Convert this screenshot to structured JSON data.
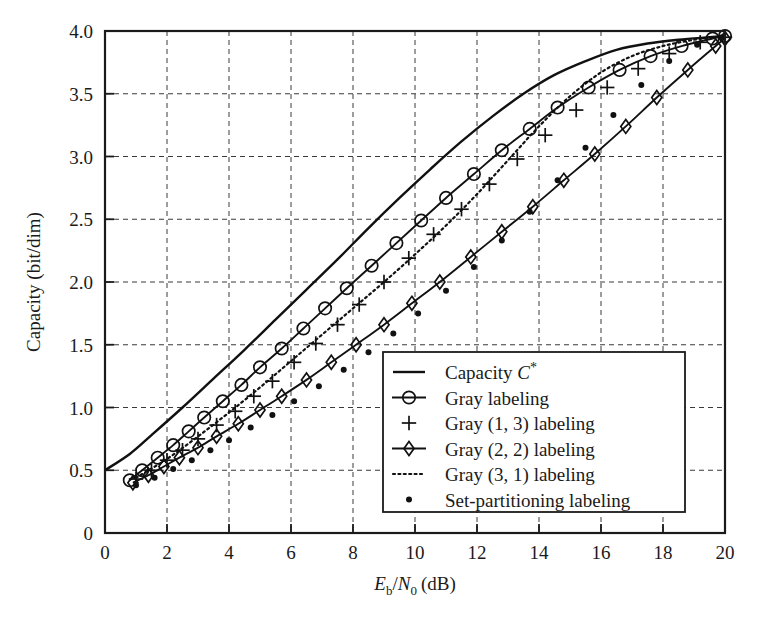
{
  "chart_data": {
    "type": "line",
    "title": "",
    "xlabel": "E_b/N_0 (dB)",
    "xlabel_parts": {
      "main": "E",
      "sub1": "b",
      "slash": "/",
      "main2": "N",
      "sub2": "0",
      "unit": "(dB)"
    },
    "ylabel": "Capacity (bit/dim)",
    "xlim": [
      0,
      20
    ],
    "ylim": [
      0,
      4.0
    ],
    "xticks": [
      0,
      2,
      4,
      6,
      8,
      10,
      12,
      14,
      16,
      18,
      20
    ],
    "xticklabels": [
      "0",
      "2",
      "4",
      "6",
      "8",
      "10",
      "12",
      "14",
      "16",
      "18",
      "20"
    ],
    "yticks": [
      0,
      0.5,
      1.0,
      1.5,
      2.0,
      2.5,
      3.0,
      3.5,
      4.0
    ],
    "yticklabels": [
      "0",
      "0.5",
      "1.0",
      "1.5",
      "2.0",
      "2.5",
      "3.0",
      "3.5",
      "4.0"
    ],
    "grid": true,
    "grid_style": "dashed",
    "legend_position": "lower-right-inside",
    "series": [
      {
        "name": "Capacity C*",
        "label_main": "Capacity",
        "label_italic": "C",
        "label_sup": "*",
        "style": "solid",
        "marker": "none",
        "color": "#111111",
        "x": [
          0.0,
          0.8,
          1.5,
          2.5,
          3.5,
          4.5,
          5.5,
          6.5,
          7.5,
          8.5,
          9.5,
          10.5,
          11.5,
          12.5,
          13.5,
          14.5,
          15.5,
          16.5,
          17.5,
          18.5,
          19.5,
          20.0
        ],
        "y": [
          0.5,
          0.63,
          0.78,
          1.0,
          1.23,
          1.46,
          1.7,
          1.94,
          2.18,
          2.43,
          2.67,
          2.9,
          3.12,
          3.32,
          3.5,
          3.65,
          3.76,
          3.85,
          3.9,
          3.93,
          3.95,
          3.96
        ]
      },
      {
        "name": "Gray labeling",
        "label_main": "Gray labeling",
        "style": "solid",
        "marker": "circle",
        "color": "#111111",
        "x": [
          0.8,
          1.2,
          1.7,
          2.2,
          2.7,
          3.2,
          3.8,
          4.4,
          5.0,
          5.7,
          6.4,
          7.1,
          7.8,
          8.6,
          9.4,
          10.2,
          11.0,
          11.9,
          12.8,
          13.7,
          14.6,
          15.6,
          16.6,
          17.6,
          18.6,
          19.6,
          20.0
        ],
        "y": [
          0.42,
          0.5,
          0.6,
          0.7,
          0.81,
          0.92,
          1.05,
          1.18,
          1.32,
          1.47,
          1.63,
          1.79,
          1.95,
          2.13,
          2.31,
          2.49,
          2.67,
          2.86,
          3.05,
          3.22,
          3.39,
          3.55,
          3.69,
          3.8,
          3.88,
          3.94,
          3.96
        ]
      },
      {
        "name": "Gray (1, 3) labeling",
        "label_main": "Gray (1, 3) labeling",
        "style": "markers",
        "marker": "plus",
        "color": "#111111",
        "x": [
          1.0,
          1.5,
          2.0,
          2.5,
          3.0,
          3.6,
          4.2,
          4.8,
          5.4,
          6.1,
          6.8,
          7.5,
          8.2,
          9.0,
          9.8,
          10.6,
          11.5,
          12.4,
          13.3,
          14.2,
          15.2,
          16.2,
          17.2,
          18.2,
          19.2,
          20.0
        ],
        "y": [
          0.43,
          0.5,
          0.58,
          0.66,
          0.75,
          0.86,
          0.97,
          1.09,
          1.21,
          1.36,
          1.51,
          1.66,
          1.82,
          2.0,
          2.19,
          2.38,
          2.58,
          2.78,
          2.98,
          3.17,
          3.37,
          3.55,
          3.7,
          3.82,
          3.91,
          3.95
        ]
      },
      {
        "name": "Gray (2, 2) labeling",
        "label_main": "Gray (2, 2) labeling",
        "style": "solid",
        "marker": "diamond",
        "color": "#111111",
        "x": [
          0.9,
          1.4,
          1.9,
          2.4,
          3.0,
          3.6,
          4.3,
          5.0,
          5.7,
          6.5,
          7.3,
          8.1,
          9.0,
          9.9,
          10.8,
          11.8,
          12.8,
          13.8,
          14.8,
          15.8,
          16.8,
          17.8,
          18.8,
          19.7,
          20.0
        ],
        "y": [
          0.4,
          0.46,
          0.53,
          0.6,
          0.68,
          0.77,
          0.87,
          0.98,
          1.09,
          1.22,
          1.36,
          1.5,
          1.66,
          1.83,
          2.0,
          2.2,
          2.4,
          2.6,
          2.81,
          3.02,
          3.24,
          3.47,
          3.69,
          3.88,
          3.94
        ]
      },
      {
        "name": "Gray (3, 1) labeling",
        "label_main": "Gray (3, 1) labeling",
        "style": "dotted",
        "marker": "none",
        "color": "#111111",
        "x": [
          1.0,
          2.0,
          3.0,
          4.0,
          5.0,
          6.0,
          7.0,
          8.0,
          9.0,
          10.0,
          11.0,
          12.0,
          13.0,
          14.0,
          15.0,
          16.0,
          17.0,
          18.0,
          19.0,
          20.0
        ],
        "y": [
          0.44,
          0.59,
          0.77,
          0.96,
          1.16,
          1.37,
          1.58,
          1.79,
          2.0,
          2.22,
          2.45,
          2.7,
          2.97,
          3.24,
          3.48,
          3.67,
          3.8,
          3.88,
          3.93,
          3.96
        ]
      },
      {
        "name": "Set-partitioning labeling",
        "label_main": "Set-partitioning labeling",
        "style": "markers",
        "marker": "dot",
        "color": "#111111",
        "x": [
          1.0,
          1.6,
          2.2,
          2.8,
          3.4,
          4.0,
          4.7,
          5.4,
          6.1,
          6.9,
          7.7,
          8.5,
          9.3,
          10.1,
          11.0,
          11.9,
          12.8,
          13.7,
          14.6,
          15.5,
          16.4,
          17.3,
          18.2,
          19.1,
          19.9
        ],
        "y": [
          0.38,
          0.44,
          0.51,
          0.58,
          0.66,
          0.74,
          0.84,
          0.94,
          1.05,
          1.17,
          1.3,
          1.44,
          1.59,
          1.75,
          1.93,
          2.12,
          2.33,
          2.56,
          2.81,
          3.07,
          3.33,
          3.57,
          3.76,
          3.89,
          3.95
        ]
      }
    ]
  },
  "legend": {
    "items": [
      {
        "label": "Capacity C*",
        "glyph": "line"
      },
      {
        "label": "Gray labeling",
        "glyph": "line-circle"
      },
      {
        "label": "Gray (1, 3) labeling",
        "glyph": "plus"
      },
      {
        "label": "Gray (2, 2) labeling",
        "glyph": "line-diamond"
      },
      {
        "label": "Gray (3, 1) labeling",
        "glyph": "dotted"
      },
      {
        "label": "Set-partitioning labeling",
        "glyph": "dot"
      }
    ]
  }
}
